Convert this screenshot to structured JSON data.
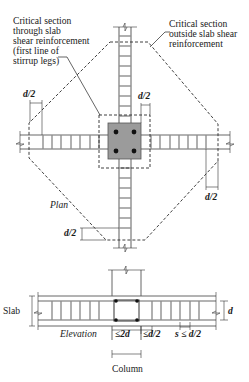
{
  "figure": {
    "plan_label": "Plan",
    "elevation_label": "Elevation",
    "annotations": {
      "critical_inside": [
        "Critical section",
        "through slab",
        "shear reinforcement",
        "(first line of",
        "stirrup legs)"
      ],
      "critical_outside": [
        "Critical section",
        "outside slab shear",
        "reinforcement"
      ]
    },
    "dimensions": {
      "d2_top_left": "d/2",
      "d2_top_center": "d/2",
      "d2_right": "d/2",
      "d2_left_bottom": "d/2",
      "elev_le2d": "≤2d",
      "elev_led2": "≤d/2",
      "elev_s": "s ≤ d/2",
      "elev_d": "d",
      "slab": "Slab",
      "column": "Column"
    },
    "colors": {
      "rebar": "#9a9a9a",
      "column_fill": "#9b9b9b",
      "dashed_line": "#2a2a2a",
      "text": "#1a1a1a"
    }
  }
}
